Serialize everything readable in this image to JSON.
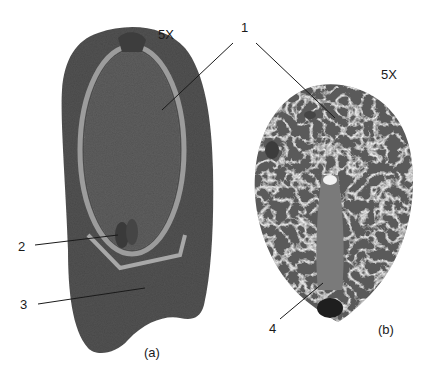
{
  "figure": {
    "panel_a": {
      "caption": "(a)",
      "magnification": "5X"
    },
    "panel_b": {
      "caption": "(b)",
      "magnification": "5X"
    },
    "callouts": [
      {
        "number": "1"
      },
      {
        "number": "2"
      },
      {
        "number": "3"
      },
      {
        "number": "4"
      }
    ],
    "colors": {
      "background": "#ffffff",
      "tissue_dark": "#4a4a4a",
      "tissue_mid": "#6e6e6e",
      "tissue_light": "#a8a8a8",
      "line": "#1a1a1a"
    }
  }
}
